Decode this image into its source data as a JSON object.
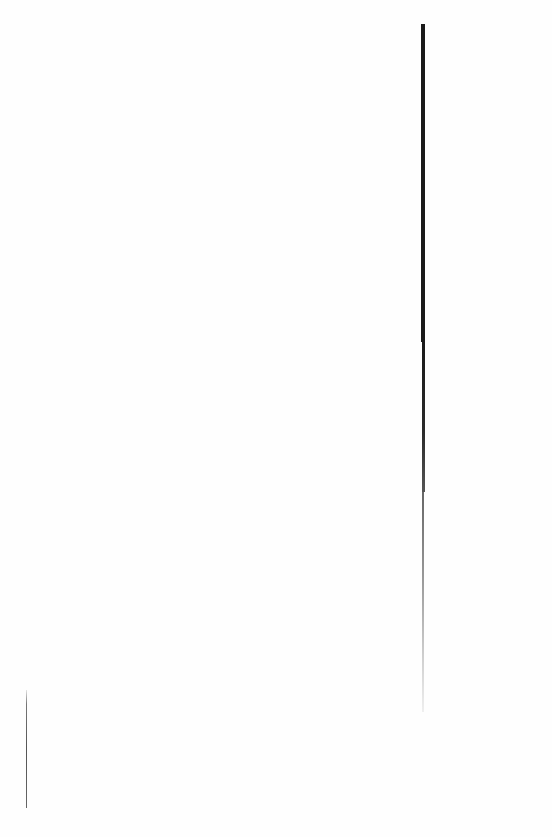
{
  "page": {
    "background": "#fefefe"
  },
  "marks": {
    "main_vertical_line": {
      "color": "#1a1a1a"
    },
    "left_vertical_line": {
      "color": "#555555"
    }
  }
}
